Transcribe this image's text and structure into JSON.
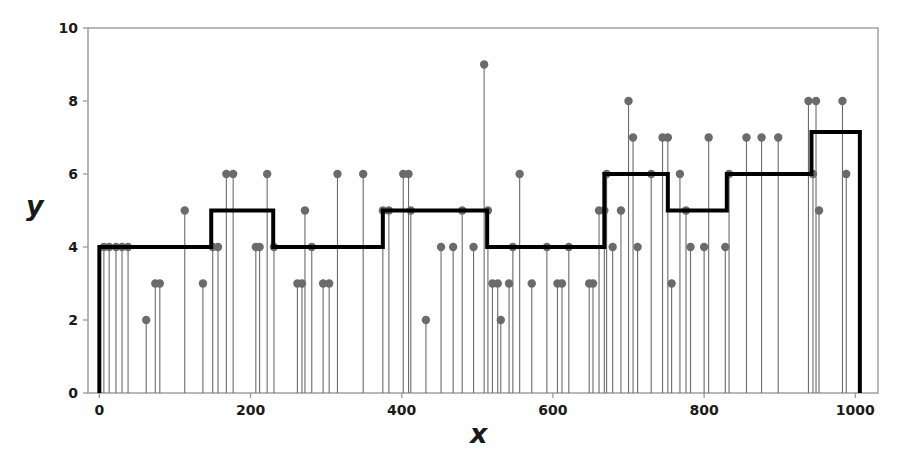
{
  "chart_data": {
    "type": "line",
    "title": "",
    "xlabel": "x",
    "ylabel": "y",
    "xlim": [
      -15,
      1030
    ],
    "ylim": [
      0,
      10
    ],
    "xticks": [
      0,
      200,
      400,
      600,
      800,
      1000
    ],
    "yticks": [
      0,
      2,
      4,
      6,
      8,
      10
    ],
    "grid": false,
    "legend": null,
    "series": [
      {
        "name": "observations",
        "type": "stem",
        "marker": "circle",
        "color": "#6b6b6b",
        "baseline": 0,
        "points": [
          {
            "x": 6,
            "y": 4
          },
          {
            "x": 13,
            "y": 4
          },
          {
            "x": 22,
            "y": 4
          },
          {
            "x": 30,
            "y": 4
          },
          {
            "x": 38,
            "y": 4
          },
          {
            "x": 62,
            "y": 2
          },
          {
            "x": 74,
            "y": 3
          },
          {
            "x": 80,
            "y": 3
          },
          {
            "x": 113,
            "y": 5
          },
          {
            "x": 137,
            "y": 3
          },
          {
            "x": 150,
            "y": 4
          },
          {
            "x": 157,
            "y": 4
          },
          {
            "x": 168,
            "y": 6
          },
          {
            "x": 177,
            "y": 6
          },
          {
            "x": 207,
            "y": 4
          },
          {
            "x": 212,
            "y": 4
          },
          {
            "x": 222,
            "y": 6
          },
          {
            "x": 231,
            "y": 4
          },
          {
            "x": 262,
            "y": 3
          },
          {
            "x": 268,
            "y": 3
          },
          {
            "x": 272,
            "y": 5
          },
          {
            "x": 281,
            "y": 4
          },
          {
            "x": 296,
            "y": 3
          },
          {
            "x": 304,
            "y": 3
          },
          {
            "x": 315,
            "y": 6
          },
          {
            "x": 349,
            "y": 6
          },
          {
            "x": 375,
            "y": 5
          },
          {
            "x": 383,
            "y": 5
          },
          {
            "x": 402,
            "y": 6
          },
          {
            "x": 409,
            "y": 6
          },
          {
            "x": 412,
            "y": 5
          },
          {
            "x": 432,
            "y": 2
          },
          {
            "x": 452,
            "y": 4
          },
          {
            "x": 468,
            "y": 4
          },
          {
            "x": 480,
            "y": 5
          },
          {
            "x": 495,
            "y": 4
          },
          {
            "x": 509,
            "y": 9
          },
          {
            "x": 514,
            "y": 5
          },
          {
            "x": 520,
            "y": 3
          },
          {
            "x": 527,
            "y": 3
          },
          {
            "x": 531,
            "y": 2
          },
          {
            "x": 542,
            "y": 3
          },
          {
            "x": 547,
            "y": 4
          },
          {
            "x": 556,
            "y": 6
          },
          {
            "x": 572,
            "y": 3
          },
          {
            "x": 592,
            "y": 4
          },
          {
            "x": 606,
            "y": 3
          },
          {
            "x": 612,
            "y": 3
          },
          {
            "x": 621,
            "y": 4
          },
          {
            "x": 648,
            "y": 3
          },
          {
            "x": 653,
            "y": 3
          },
          {
            "x": 661,
            "y": 5
          },
          {
            "x": 668,
            "y": 5
          },
          {
            "x": 671,
            "y": 6
          },
          {
            "x": 679,
            "y": 4
          },
          {
            "x": 690,
            "y": 5
          },
          {
            "x": 700,
            "y": 8
          },
          {
            "x": 706,
            "y": 7
          },
          {
            "x": 712,
            "y": 4
          },
          {
            "x": 730,
            "y": 6
          },
          {
            "x": 745,
            "y": 7
          },
          {
            "x": 752,
            "y": 7
          },
          {
            "x": 757,
            "y": 3
          },
          {
            "x": 768,
            "y": 6
          },
          {
            "x": 776,
            "y": 5
          },
          {
            "x": 782,
            "y": 4
          },
          {
            "x": 800,
            "y": 4
          },
          {
            "x": 806,
            "y": 7
          },
          {
            "x": 828,
            "y": 4
          },
          {
            "x": 833,
            "y": 6
          },
          {
            "x": 856,
            "y": 7
          },
          {
            "x": 876,
            "y": 7
          },
          {
            "x": 898,
            "y": 7
          },
          {
            "x": 938,
            "y": 8
          },
          {
            "x": 944,
            "y": 6
          },
          {
            "x": 948,
            "y": 8
          },
          {
            "x": 952,
            "y": 5
          },
          {
            "x": 983,
            "y": 8
          },
          {
            "x": 988,
            "y": 6
          }
        ]
      },
      {
        "name": "step-fit",
        "type": "step",
        "color": "#000000",
        "linewidth": 4,
        "steps": [
          {
            "x_start": 0,
            "x_end": 148,
            "level": 4
          },
          {
            "x_start": 148,
            "x_end": 230,
            "level": 5
          },
          {
            "x_start": 230,
            "x_end": 375,
            "level": 4
          },
          {
            "x_start": 375,
            "x_end": 513,
            "level": 5
          },
          {
            "x_start": 513,
            "x_end": 668,
            "level": 4
          },
          {
            "x_start": 668,
            "x_end": 752,
            "level": 6
          },
          {
            "x_start": 752,
            "x_end": 830,
            "level": 5
          },
          {
            "x_start": 830,
            "x_end": 942,
            "level": 6
          },
          {
            "x_start": 942,
            "x_end": 1006,
            "level": 7.15
          }
        ]
      }
    ]
  },
  "axes": {
    "x_tick_labels": [
      "0",
      "200",
      "400",
      "600",
      "800",
      "1000"
    ],
    "y_tick_labels": [
      "0",
      "2",
      "4",
      "6",
      "8",
      "10"
    ],
    "x_axis_title": "x",
    "y_axis_title": "y"
  },
  "colors": {
    "stem": "#6b6b6b",
    "step": "#000000",
    "frame": "#9a9a9a",
    "text": "#1a1a1a",
    "background": "#ffffff"
  }
}
